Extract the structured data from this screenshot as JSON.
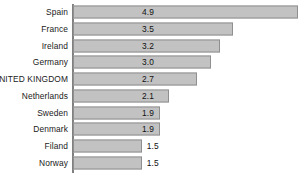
{
  "chart_data": {
    "type": "bar",
    "orientation": "horizontal",
    "title": "",
    "subtitle": "",
    "xlabel": "",
    "ylabel": "",
    "grid": false,
    "legend": null,
    "legend_position": "none",
    "xlim": [
      0,
      4.9
    ],
    "categories": [
      "Spain",
      "France",
      "Ireland",
      "Germany",
      "UNITED KINGDOM",
      "Netherlands",
      "Sweden",
      "Denmark",
      "Filand",
      "Norway"
    ],
    "values": [
      4.9,
      3.5,
      3.2,
      3.0,
      2.7,
      2.1,
      1.9,
      1.9,
      1.5,
      1.5
    ],
    "value_labels": [
      "4.9",
      "3.5",
      "3.2",
      "3.0",
      "2.7",
      "2.1",
      "1.9",
      "1.9",
      "1.5",
      "1.5"
    ],
    "tick_labels": [],
    "annotations": []
  },
  "style": {
    "bar_fill": "#c2c2c2",
    "bar_border": "#8f8f8f",
    "axis_color": "#808080",
    "text_color": "#1a1a1a",
    "background": "#ffffff"
  }
}
